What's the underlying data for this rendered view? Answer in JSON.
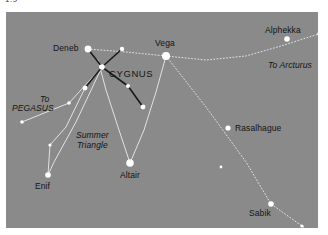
{
  "top_caption": "1.9",
  "chart": {
    "background_color": "#8a8a8a",
    "frame": {
      "x": 6,
      "y": 12,
      "width": 312,
      "height": 216
    },
    "line_colors": {
      "constellation_line": "#1b1b1b",
      "guide_line": "#e8e8e8",
      "star_fill": "#ffffff"
    },
    "stars": [
      {
        "name": "Deneb",
        "x": 82,
        "y": 37,
        "r": 3.4,
        "label_x": 47,
        "label_y": 31,
        "label": "Deneb"
      },
      {
        "name": "Vega",
        "x": 160,
        "y": 44,
        "r": 4.0,
        "label_x": 149,
        "label_y": 26,
        "label": "Vega"
      },
      {
        "name": "Altair",
        "x": 124,
        "y": 151,
        "r": 3.8,
        "label_x": 114,
        "label_y": 158,
        "label": "Altair"
      },
      {
        "name": "Alphekka",
        "x": 281,
        "y": 27,
        "r": 2.8,
        "label_x": 259,
        "label_y": 13,
        "label": "Alphekka"
      },
      {
        "name": "Rasalhague",
        "x": 222,
        "y": 116,
        "r": 2.6,
        "label_x": 229,
        "label_y": 111,
        "label": "Rasalhague"
      },
      {
        "name": "Sabik",
        "x": 265,
        "y": 192,
        "r": 2.8,
        "label_x": 243,
        "label_y": 196,
        "label": "Sabik"
      },
      {
        "name": "Antares",
        "x": 307,
        "y": 222,
        "r": 2.8,
        "label_x": 277,
        "label_y": 219,
        "label": "Antares"
      },
      {
        "name": "Enif",
        "x": 42,
        "y": 163,
        "r": 2.8,
        "label_x": 29,
        "label_y": 169,
        "label": "Enif"
      },
      {
        "name": "cygnus-center",
        "x": 96,
        "y": 55,
        "r": 2.8
      },
      {
        "name": "cygnus-upper-right",
        "x": 116,
        "y": 37,
        "r": 2.2
      },
      {
        "name": "cygnus-lower-left",
        "x": 79,
        "y": 76,
        "r": 2.4
      },
      {
        "name": "cygnus-mid-right",
        "x": 122,
        "y": 74,
        "r": 2.0
      },
      {
        "name": "cygnus-far-right",
        "x": 137,
        "y": 95,
        "r": 2.4
      },
      {
        "name": "pegasus-star",
        "x": 63,
        "y": 91,
        "r": 1.8
      },
      {
        "name": "lower-left-faint",
        "x": 16,
        "y": 110,
        "r": 1.8
      },
      {
        "name": "enif-upper",
        "x": 44,
        "y": 133,
        "r": 1.6
      },
      {
        "name": "arcturus-edge",
        "x": 313,
        "y": 22,
        "r": 1.8
      },
      {
        "name": "antares-companion",
        "x": 296,
        "y": 214,
        "r": 1.6
      },
      {
        "name": "ophiuchus-faint",
        "x": 215,
        "y": 155,
        "r": 1.4
      }
    ],
    "constellation_lines": [
      {
        "from": [
          82,
          37
        ],
        "to": [
          96,
          55
        ]
      },
      {
        "from": [
          96,
          55
        ],
        "to": [
          116,
          37
        ]
      },
      {
        "from": [
          96,
          55
        ],
        "to": [
          79,
          76
        ]
      },
      {
        "from": [
          96,
          55
        ],
        "to": [
          122,
          74
        ]
      },
      {
        "from": [
          122,
          74
        ],
        "to": [
          137,
          95
        ]
      }
    ],
    "guide_lines": [
      {
        "name": "vega-to-arcturus",
        "points": [
          [
            160,
            44
          ],
          [
            200,
            48
          ],
          [
            240,
            44
          ],
          [
            275,
            34
          ],
          [
            300,
            26
          ],
          [
            313,
            22
          ]
        ],
        "style": "dotted"
      },
      {
        "name": "deneb-to-vega",
        "points": [
          [
            82,
            37
          ],
          [
            120,
            40
          ],
          [
            160,
            44
          ]
        ],
        "style": "dotted"
      },
      {
        "name": "vega-to-altair",
        "points": [
          [
            160,
            44
          ],
          [
            150,
            80
          ],
          [
            138,
            118
          ],
          [
            124,
            151
          ]
        ],
        "style": "solid"
      },
      {
        "name": "altair-to-deneb",
        "points": [
          [
            124,
            151
          ],
          [
            112,
            115
          ],
          [
            100,
            78
          ],
          [
            92,
            48
          ]
        ],
        "style": "solid"
      },
      {
        "name": "vega-to-antares",
        "points": [
          [
            160,
            44
          ],
          [
            200,
            95
          ],
          [
            240,
            150
          ],
          [
            265,
            192
          ],
          [
            296,
            214
          ],
          [
            307,
            222
          ]
        ],
        "style": "dotted"
      },
      {
        "name": "pegasus-ray-upper",
        "points": [
          [
            96,
            55
          ],
          [
            63,
            91
          ],
          [
            16,
            110
          ]
        ],
        "style": "solid"
      },
      {
        "name": "pegasus-ray-lower",
        "points": [
          [
            79,
            76
          ],
          [
            60,
            115
          ],
          [
            44,
            133
          ],
          [
            42,
            163
          ]
        ],
        "style": "solid"
      },
      {
        "name": "cygnus-to-enif",
        "points": [
          [
            96,
            55
          ],
          [
            70,
            110
          ],
          [
            48,
            150
          ],
          [
            42,
            163
          ]
        ],
        "style": "solid"
      }
    ],
    "text_labels": [
      {
        "name": "cygnus-label",
        "text": "CYGNUS",
        "x": 103,
        "y": 57,
        "style": "constellation"
      },
      {
        "name": "to-arcturus-label",
        "text": "To Arcturus",
        "x": 262,
        "y": 48,
        "style": "italic"
      },
      {
        "name": "to-pegasus-label-line1",
        "text": "To",
        "x": 34,
        "y": 82,
        "style": "italic"
      },
      {
        "name": "to-pegasus-label-line2",
        "text": "PEGASUS",
        "x": 6,
        "y": 91,
        "style": "italic"
      },
      {
        "name": "summer-triangle-label",
        "text": "Summer\nTriangle",
        "x": 70,
        "y": 119,
        "style": "italic"
      }
    ]
  }
}
